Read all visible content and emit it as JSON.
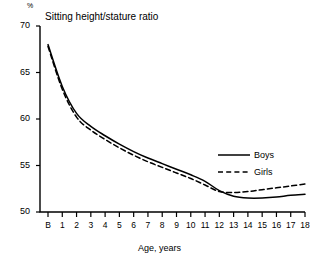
{
  "chart_data": {
    "type": "line",
    "title": "Sitting height/stature ratio",
    "unit": "%",
    "xlabel": "Age, years",
    "ylabel": "",
    "ylim": [
      50,
      70
    ],
    "yticks": [
      50,
      55,
      60,
      65,
      70
    ],
    "xtick_labels": [
      "B",
      "1",
      "2",
      "3",
      "4",
      "5",
      "6",
      "7",
      "8",
      "9",
      "10",
      "11",
      "12",
      "13",
      "14",
      "15",
      "16",
      "17",
      "18"
    ],
    "x": [
      0,
      1,
      2,
      3,
      4,
      5,
      6,
      7,
      8,
      9,
      10,
      11,
      12,
      13,
      14,
      15,
      16,
      17,
      18
    ],
    "grid": false,
    "legend_position": "right-middle",
    "series": [
      {
        "name": "Boys",
        "style": "solid",
        "color": "#000000",
        "values": [
          68.0,
          63.5,
          60.6,
          59.2,
          58.2,
          57.3,
          56.5,
          55.8,
          55.2,
          54.6,
          54.0,
          53.3,
          52.3,
          51.7,
          51.5,
          51.5,
          51.6,
          51.8,
          51.9
        ]
      },
      {
        "name": "Girls",
        "style": "dashed",
        "color": "#000000",
        "values": [
          67.8,
          63.2,
          60.2,
          58.8,
          57.8,
          56.9,
          56.1,
          55.4,
          54.8,
          54.2,
          53.6,
          52.9,
          52.2,
          52.1,
          52.2,
          52.4,
          52.6,
          52.8,
          53.0
        ]
      }
    ]
  },
  "legend": {
    "boys_label": "Boys",
    "girls_label": "Girls"
  }
}
